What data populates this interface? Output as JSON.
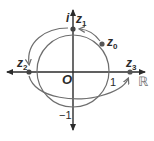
{
  "diagram": {
    "title": "",
    "axes": {
      "imaginary_label": "i",
      "real_label": "ℝ",
      "origin_label": "O",
      "tick_one": "1",
      "tick_minus_one": "−1"
    },
    "points": [
      {
        "name": "z",
        "sub": "0"
      },
      {
        "name": "z",
        "sub": "1"
      },
      {
        "name": "z",
        "sub": "2"
      },
      {
        "name": "z",
        "sub": "3"
      }
    ],
    "colors": {
      "axis": "#2b2b2b",
      "circle": "#6e6e6e",
      "path": "#6e6e6e",
      "point": "#555555"
    }
  }
}
